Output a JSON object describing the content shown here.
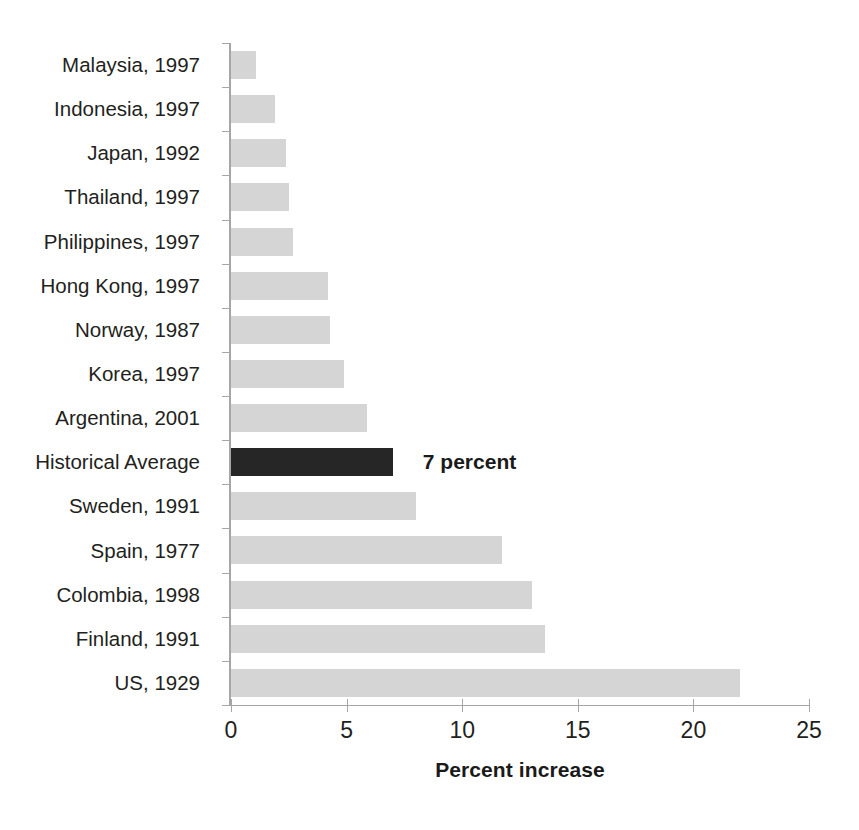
{
  "chart_data": {
    "type": "bar",
    "orientation": "horizontal",
    "title": "",
    "xlabel": "Percent increase",
    "ylabel": "",
    "xlim": [
      0,
      25
    ],
    "xticks": [
      0,
      5,
      10,
      15,
      20,
      25
    ],
    "grid": false,
    "legend": null,
    "categories": [
      "Malaysia, 1997",
      "Indonesia, 1997",
      "Japan, 1992",
      "Thailand, 1997",
      "Philippines, 1997",
      "Hong Kong, 1997",
      "Norway, 1987",
      "Korea, 1997",
      "Argentina, 2001",
      "Historical Average",
      "Sweden, 1991",
      "Spain, 1977",
      "Colombia, 1998",
      "Finland, 1991",
      "US, 1929"
    ],
    "values": [
      1.1,
      1.9,
      2.4,
      2.5,
      2.7,
      4.2,
      4.3,
      4.9,
      5.9,
      7.0,
      8.0,
      11.7,
      13.0,
      13.6,
      22.0
    ],
    "highlight_index": 9,
    "annotations": [
      {
        "index": 9,
        "text": "7 percent"
      }
    ],
    "colors": {
      "bar": "#d5d5d5",
      "highlight_bar": "#262626",
      "axis": "#a6a6a6",
      "text": "#231f20"
    }
  }
}
